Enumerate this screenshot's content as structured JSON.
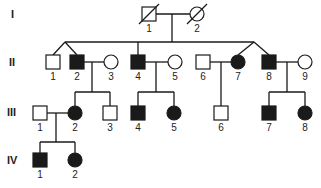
{
  "colors": {
    "line": "#1a1a1a",
    "affected": "#1a1a1a",
    "unaffected": "#ffffff"
  },
  "generations": [
    {
      "label": "I",
      "y": 18
    },
    {
      "label": "II",
      "y": 66
    },
    {
      "label": "III",
      "y": 116
    },
    {
      "label": "IV",
      "y": 164
    }
  ],
  "individuals": [
    {
      "id": "I-1",
      "num": "1",
      "sex": "male",
      "affected": false,
      "deceased": true,
      "cx": 149,
      "cy": 14
    },
    {
      "id": "I-2",
      "num": "2",
      "sex": "female",
      "affected": false,
      "deceased": true,
      "cx": 197,
      "cy": 14
    },
    {
      "id": "II-1",
      "num": "1",
      "sex": "male",
      "affected": false,
      "cx": 53,
      "cy": 62
    },
    {
      "id": "II-2",
      "num": "2",
      "sex": "male",
      "affected": true,
      "cx": 77,
      "cy": 62
    },
    {
      "id": "II-3",
      "num": "3",
      "sex": "female",
      "affected": false,
      "cx": 111,
      "cy": 62
    },
    {
      "id": "II-4",
      "num": "4",
      "sex": "male",
      "affected": true,
      "cx": 138,
      "cy": 62
    },
    {
      "id": "II-5",
      "num": "5",
      "sex": "female",
      "affected": false,
      "cx": 175,
      "cy": 62
    },
    {
      "id": "II-6",
      "num": "6",
      "sex": "male",
      "affected": false,
      "cx": 203,
      "cy": 62
    },
    {
      "id": "II-7",
      "num": "7",
      "sex": "female",
      "affected": true,
      "cx": 238,
      "cy": 62
    },
    {
      "id": "II-8",
      "num": "8",
      "sex": "male",
      "affected": true,
      "cx": 269,
      "cy": 62
    },
    {
      "id": "II-9",
      "num": "9",
      "sex": "female",
      "affected": false,
      "cx": 305,
      "cy": 62
    },
    {
      "id": "III-1",
      "num": "1",
      "sex": "male",
      "affected": false,
      "cx": 40,
      "cy": 113
    },
    {
      "id": "III-2",
      "num": "2",
      "sex": "female",
      "affected": true,
      "cx": 75,
      "cy": 113
    },
    {
      "id": "III-3",
      "num": "3",
      "sex": "male",
      "affected": false,
      "cx": 110,
      "cy": 113
    },
    {
      "id": "III-4",
      "num": "4",
      "sex": "male",
      "affected": true,
      "cx": 138,
      "cy": 113
    },
    {
      "id": "III-5",
      "num": "5",
      "sex": "female",
      "affected": true,
      "cx": 174,
      "cy": 113
    },
    {
      "id": "III-6",
      "num": "6",
      "sex": "male",
      "affected": false,
      "cx": 221,
      "cy": 113
    },
    {
      "id": "III-7",
      "num": "7",
      "sex": "male",
      "affected": true,
      "cx": 269,
      "cy": 113
    },
    {
      "id": "III-8",
      "num": "8",
      "sex": "female",
      "affected": true,
      "cx": 305,
      "cy": 113
    },
    {
      "id": "IV-1",
      "num": "1",
      "sex": "male",
      "affected": true,
      "cx": 40,
      "cy": 160
    },
    {
      "id": "IV-2",
      "num": "2",
      "sex": "female",
      "affected": true,
      "cx": 75,
      "cy": 160
    }
  ],
  "relationships": {
    "marriages": [
      "I-1 x I-2",
      "II-2 x II-3",
      "II-4 x II-5",
      "II-6 x II-7",
      "II-8 x II-9",
      "III-1 x III-2"
    ],
    "twins": [
      "II-1 & II-2",
      "II-7 & II-8"
    ]
  }
}
